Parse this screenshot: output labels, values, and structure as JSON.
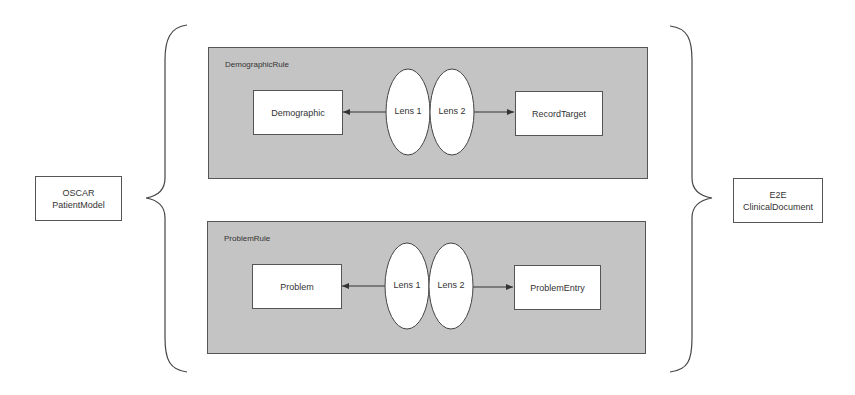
{
  "left_model": {
    "line1": "OSCAR",
    "line2": "PatientModel"
  },
  "right_model": {
    "line1": "E2E",
    "line2": "ClinicalDocument"
  },
  "rules": [
    {
      "title": "DemographicRule",
      "source": "Demographic",
      "lens1": "Lens 1",
      "lens2": "Lens 2",
      "target": "RecordTarget"
    },
    {
      "title": "ProblemRule",
      "source": "Problem",
      "lens1": "Lens 1",
      "lens2": "Lens 2",
      "target": "ProblemEntry"
    }
  ],
  "colors": {
    "panel_fill": "#c4c4c4",
    "stroke": "#555555",
    "box_fill": "#ffffff"
  }
}
